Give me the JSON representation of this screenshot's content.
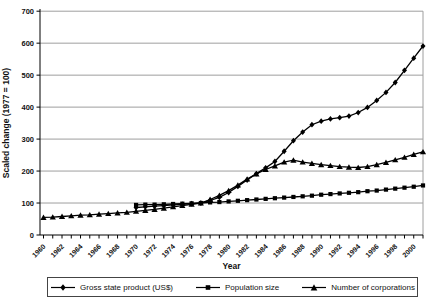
{
  "colors": {
    "series": "#000000",
    "grid": "#9e9e9e",
    "axis": "#000000",
    "text": "#111111",
    "background": "#ffffff",
    "legend_border": "#444444"
  },
  "chart_data": {
    "type": "line",
    "title": "",
    "xlabel": "Year",
    "ylabel": "Scaled change (1977 = 100)",
    "ylim": [
      0,
      700
    ],
    "ytick_step": 100,
    "x_range": [
      1960,
      2001
    ],
    "xticks": [
      1960,
      1962,
      1964,
      1966,
      1968,
      1970,
      1972,
      1974,
      1976,
      1978,
      1980,
      1982,
      1984,
      1986,
      1988,
      1990,
      1992,
      1994,
      1996,
      1998,
      2000
    ],
    "grid": "horizontal",
    "legend_position": "bottom",
    "series": [
      {
        "name": "Gross state product (US$)",
        "marker": "diamond",
        "start_year": 1970,
        "step_years": 1,
        "values": [
          86,
          88,
          90,
          92,
          94,
          96,
          98,
          100,
          108,
          118,
          133,
          152,
          172,
          192,
          210,
          230,
          262,
          295,
          322,
          345,
          356,
          363,
          367,
          372,
          383,
          399,
          421,
          446,
          477,
          515,
          553,
          591
        ]
      },
      {
        "name": "Population size",
        "marker": "square",
        "start_year": 1970,
        "step_years": 1,
        "values": [
          94,
          95,
          95,
          96,
          97,
          98,
          99,
          100,
          102,
          103,
          105,
          107,
          109,
          111,
          113,
          115,
          117,
          119,
          121,
          123,
          126,
          128,
          130,
          132,
          134,
          137,
          139,
          142,
          145,
          148,
          151,
          155
        ]
      },
      {
        "name": "Number of corporations",
        "marker": "triangle",
        "start_year": 1960,
        "step_years": 1,
        "values": [
          55,
          56,
          58,
          60,
          62,
          63,
          65,
          67,
          69,
          71,
          74,
          77,
          80,
          84,
          88,
          92,
          96,
          100,
          111,
          124,
          139,
          156,
          175,
          191,
          205,
          216,
          228,
          234,
          228,
          224,
          220,
          217,
          214,
          212,
          211,
          214,
          220,
          227,
          235,
          243,
          252,
          260
        ]
      }
    ]
  }
}
